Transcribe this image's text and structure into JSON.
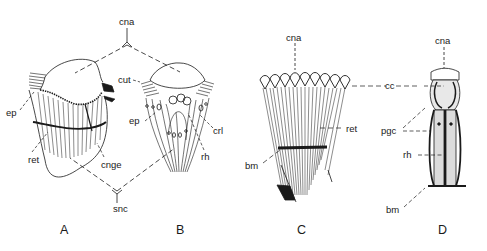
{
  "figure": {
    "panels": [
      {
        "id": "A",
        "label": "A",
        "labels": {
          "cna": "cna",
          "cut": "cut",
          "ep": "ep",
          "ret": "ret",
          "cnge": "cnge",
          "snc": "snc"
        }
      },
      {
        "id": "B",
        "label": "B",
        "labels": {
          "ep": "ep",
          "crl": "crl",
          "rh": "rh"
        }
      },
      {
        "id": "C",
        "label": "C",
        "labels": {
          "cna": "cna",
          "cc": "cc",
          "ret": "ret",
          "bm": "bm"
        }
      },
      {
        "id": "D",
        "label": "D",
        "labels": {
          "cna": "cna",
          "pgc": "pgc",
          "rh": "rh",
          "bm": "bm"
        }
      }
    ],
    "colors": {
      "ink": "#1a1a1a",
      "background": "#ffffff",
      "stipple": "#cfcfcf"
    }
  }
}
